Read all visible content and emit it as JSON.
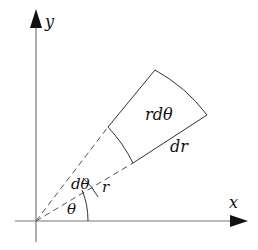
{
  "diagram": {
    "type": "polar area element",
    "axes": {
      "x_label": "x",
      "y_label": "y"
    },
    "labels": {
      "area_label": "rdθ",
      "radial_width": "dr",
      "radius": "r",
      "angle_increment": "dθ",
      "angle": "θ"
    },
    "colors": {
      "axis": "#777777",
      "stroke": "#333333",
      "dashed": "#555555",
      "text": "#111111"
    }
  }
}
